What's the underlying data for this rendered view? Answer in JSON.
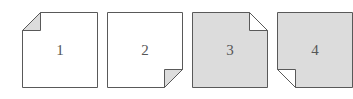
{
  "figure": {
    "name": "folded-corner-squares",
    "background_color": "#ffffff",
    "canvas": {
      "width": 350,
      "height": 99
    },
    "stroke_color": "#595959",
    "stroke_width": 1,
    "fill_white": "#ffffff",
    "fill_gray": "#dcdcdc",
    "fold_gray": "#dcdcdc",
    "fold_white": "#ffffff",
    "label_color": "#565656",
    "shapes": [
      {
        "label": "1",
        "icon": "page-fold-top-left-icon",
        "body_fill": "#ffffff",
        "fold_fill": "#dcdcdc",
        "fold_corner": "top-left",
        "fold_size": 18,
        "size": 76,
        "x": 22,
        "y": 12
      },
      {
        "label": "2",
        "icon": "page-fold-bottom-right-icon",
        "body_fill": "#ffffff",
        "fold_fill": "#dcdcdc",
        "fold_corner": "bottom-right",
        "fold_size": 18,
        "size": 76,
        "x": 107,
        "y": 12
      },
      {
        "label": "3",
        "icon": "page-fold-top-right-icon",
        "body_fill": "#dcdcdc",
        "fold_fill": "#ffffff",
        "fold_corner": "top-right",
        "fold_size": 18,
        "size": 76,
        "x": 192,
        "y": 12
      },
      {
        "label": "4",
        "icon": "page-fold-bottom-left-icon",
        "body_fill": "#dcdcdc",
        "fold_fill": "#ffffff",
        "fold_corner": "bottom-left",
        "fold_size": 18,
        "size": 76,
        "x": 277,
        "y": 12
      }
    ]
  }
}
